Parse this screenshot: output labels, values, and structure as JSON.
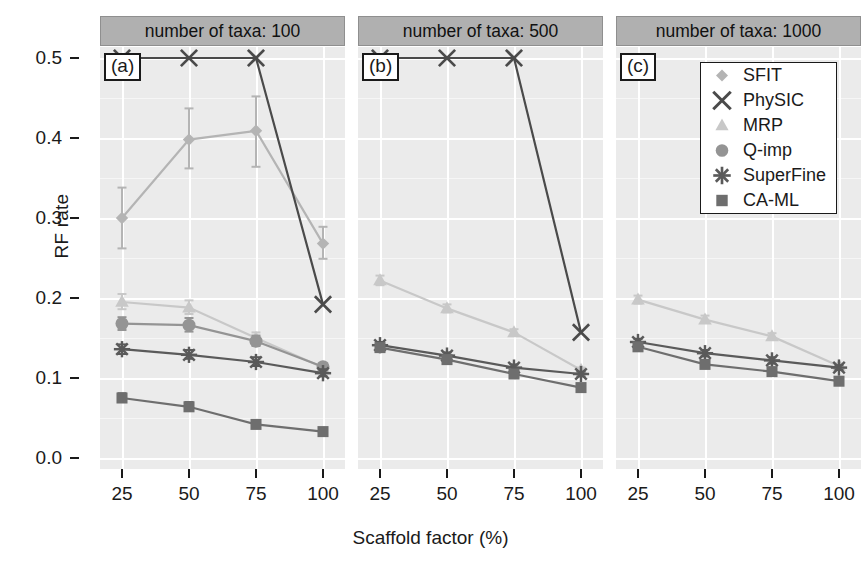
{
  "chart_data": {
    "type": "line",
    "title": "",
    "xlabel": "Scaffold factor (%)",
    "ylabel": "RF rate",
    "x": [
      25,
      50,
      75,
      100
    ],
    "xticklabels": [
      "25",
      "50",
      "75",
      "100"
    ],
    "yticklabels": [
      "0.0",
      "0.1",
      "0.2",
      "0.3",
      "0.4",
      "0.5"
    ],
    "ylim": [
      0.0,
      0.5
    ],
    "grid": true,
    "legend_position": "top-right of panel (c)",
    "legend_entries": [
      "SFIT",
      "PhySIC",
      "MRP",
      "Q-imp",
      "SuperFine",
      "CA-ML"
    ],
    "panels": [
      {
        "label": "(a)",
        "strip_title": "number of taxa: 100",
        "taxa": 100,
        "series": [
          {
            "name": "SFIT",
            "marker": "diamond",
            "color": "#b4b4b4",
            "values": [
              0.3,
              0.398,
              0.409,
              0.268
            ],
            "err_low": [
              0.262,
              0.362,
              0.364,
              0.249
            ],
            "err_high": [
              0.338,
              0.437,
              0.452,
              0.289
            ]
          },
          {
            "name": "PhySIC",
            "marker": "cross",
            "color": "#4a4a4a",
            "values": [
              0.5,
              0.5,
              0.5,
              0.192
            ],
            "err_low": [
              0.5,
              0.5,
              0.5,
              0.192
            ],
            "err_high": [
              0.5,
              0.5,
              0.5,
              0.192
            ]
          },
          {
            "name": "MRP",
            "marker": "triangle",
            "color": "#c8c8c8",
            "values": [
              0.195,
              0.188,
              0.15,
              0.113
            ],
            "err_low": [
              0.186,
              0.18,
              0.144,
              0.109
            ],
            "err_high": [
              0.205,
              0.197,
              0.157,
              0.118
            ]
          },
          {
            "name": "Q-imp",
            "marker": "circle",
            "color": "#949494",
            "values": [
              0.168,
              0.166,
              0.146,
              0.114
            ],
            "err_low": [
              0.16,
              0.158,
              0.14,
              0.11
            ],
            "err_high": [
              0.176,
              0.175,
              0.153,
              0.119
            ]
          },
          {
            "name": "SuperFine",
            "marker": "asterisk",
            "color": "#5a5a5a",
            "values": [
              0.136,
              0.129,
              0.12,
              0.106
            ],
            "err_low": [
              0.13,
              0.124,
              0.115,
              0.102
            ],
            "err_high": [
              0.142,
              0.135,
              0.126,
              0.111
            ]
          },
          {
            "name": "CA-ML",
            "marker": "square",
            "color": "#6e6e6e",
            "values": [
              0.075,
              0.064,
              0.042,
              0.033
            ],
            "err_low": [
              0.07,
              0.059,
              0.039,
              0.03
            ],
            "err_high": [
              0.081,
              0.07,
              0.046,
              0.036
            ]
          }
        ]
      },
      {
        "label": "(b)",
        "strip_title": "number of taxa: 500",
        "taxa": 500,
        "series": [
          {
            "name": "PhySIC",
            "marker": "cross",
            "color": "#4a4a4a",
            "values": [
              0.5,
              0.5,
              0.5,
              0.157
            ],
            "err_low": [
              0.5,
              0.5,
              0.5,
              0.157
            ],
            "err_high": [
              0.5,
              0.5,
              0.5,
              0.157
            ]
          },
          {
            "name": "MRP",
            "marker": "triangle",
            "color": "#c8c8c8",
            "values": [
              0.222,
              0.187,
              0.157,
              0.11
            ],
            "err_low": [
              0.216,
              0.182,
              0.153,
              0.107
            ],
            "err_high": [
              0.228,
              0.192,
              0.161,
              0.113
            ]
          },
          {
            "name": "SuperFine",
            "marker": "asterisk",
            "color": "#5a5a5a",
            "values": [
              0.141,
              0.128,
              0.113,
              0.105
            ],
            "err_low": [
              0.137,
              0.124,
              0.11,
              0.102
            ],
            "err_high": [
              0.145,
              0.132,
              0.117,
              0.108
            ]
          },
          {
            "name": "CA-ML",
            "marker": "square",
            "color": "#6e6e6e",
            "values": [
              0.138,
              0.123,
              0.105,
              0.088
            ],
            "err_low": [
              0.134,
              0.119,
              0.102,
              0.085
            ],
            "err_high": [
              0.142,
              0.127,
              0.109,
              0.091
            ]
          }
        ]
      },
      {
        "label": "(c)",
        "strip_title": "number of taxa: 1000",
        "taxa": 1000,
        "series": [
          {
            "name": "MRP",
            "marker": "triangle",
            "color": "#c8c8c8",
            "values": [
              0.198,
              0.173,
              0.152,
              0.115
            ],
            "err_low": [
              0.193,
              0.169,
              0.148,
              0.112
            ],
            "err_high": [
              0.203,
              0.178,
              0.156,
              0.118
            ]
          },
          {
            "name": "SuperFine",
            "marker": "asterisk",
            "color": "#5a5a5a",
            "values": [
              0.145,
              0.131,
              0.122,
              0.113
            ],
            "err_low": [
              0.141,
              0.127,
              0.118,
              0.11
            ],
            "err_high": [
              0.149,
              0.135,
              0.126,
              0.116
            ]
          },
          {
            "name": "CA-ML",
            "marker": "square",
            "color": "#6e6e6e",
            "values": [
              0.139,
              0.117,
              0.108,
              0.096
            ],
            "err_low": [
              0.135,
              0.113,
              0.105,
              0.093
            ],
            "err_high": [
              0.143,
              0.121,
              0.111,
              0.099
            ]
          }
        ]
      }
    ]
  },
  "colors": {
    "panel_background": "#ebebeb",
    "strip_background": "#b0b0b0",
    "gridline": "#ffffff",
    "figure_background": "#ffffff",
    "axis_text": "#1a1a1a"
  }
}
